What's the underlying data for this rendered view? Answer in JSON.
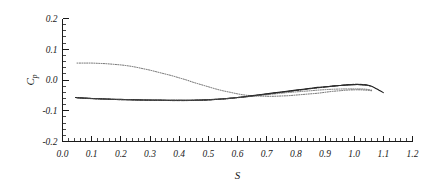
{
  "chart_data": {
    "type": "line",
    "title": "",
    "subtitle": "",
    "xlabel": "S",
    "ylabel": "C",
    "ylabel_sub": "p",
    "xlim": [
      0.0,
      1.2
    ],
    "ylim": [
      -0.2,
      0.2
    ],
    "xticks": [
      "0.0",
      "0.1",
      "0.2",
      "0.3",
      "0.4",
      "0.5",
      "0.6",
      "0.7",
      "0.8",
      "0.9",
      "1.0",
      "1.1",
      "1.2"
    ],
    "xtick_values": [
      0.0,
      0.1,
      0.2,
      0.3,
      0.4,
      0.5,
      0.6,
      0.7,
      0.8,
      0.9,
      1.0,
      1.1,
      1.2
    ],
    "yticks": [
      "0.2",
      "0.1",
      "0.0",
      "-0.1",
      "-0.2"
    ],
    "ytick_values": [
      0.2,
      0.1,
      0.0,
      -0.1,
      -0.2
    ],
    "minor_ticks_per_major": 5,
    "grid": false,
    "legend": "none",
    "legend_position": "none",
    "annotations": [],
    "series": [
      {
        "name": "upper-surface-cp",
        "style": "dotted",
        "color": "#444444",
        "width": 0.8,
        "dash": "1,1.4",
        "x": [
          0.05,
          0.075,
          0.1,
          0.125,
          0.15,
          0.175,
          0.2,
          0.225,
          0.25,
          0.275,
          0.3,
          0.325,
          0.35,
          0.375,
          0.4,
          0.425,
          0.45,
          0.475,
          0.5,
          0.525,
          0.55,
          0.575,
          0.6,
          0.625,
          0.65,
          0.675,
          0.7,
          0.725,
          0.75,
          0.775,
          0.8,
          0.825,
          0.85,
          0.875,
          0.9,
          0.925,
          0.95,
          0.975,
          1.0,
          1.02,
          1.04,
          1.06
        ],
        "y": [
          0.055,
          0.055,
          0.055,
          0.054,
          0.053,
          0.051,
          0.049,
          0.046,
          0.042,
          0.037,
          0.032,
          0.026,
          0.02,
          0.014,
          0.007,
          0.0,
          -0.008,
          -0.015,
          -0.022,
          -0.029,
          -0.035,
          -0.04,
          -0.045,
          -0.049,
          -0.051,
          -0.052,
          -0.053,
          -0.053,
          -0.052,
          -0.051,
          -0.049,
          -0.047,
          -0.045,
          -0.043,
          -0.04,
          -0.037,
          -0.035,
          -0.033,
          -0.032,
          -0.032,
          -0.033,
          -0.035
        ]
      },
      {
        "name": "lower-surface-cp-solid",
        "style": "solid",
        "color": "#1a1a1a",
        "width": 1.1,
        "dash": "",
        "x": [
          0.045,
          0.075,
          0.1,
          0.125,
          0.15,
          0.175,
          0.2,
          0.225,
          0.25,
          0.275,
          0.3,
          0.325,
          0.35,
          0.375,
          0.4,
          0.425,
          0.45,
          0.475,
          0.5,
          0.525,
          0.55,
          0.575,
          0.6,
          0.625,
          0.65,
          0.675,
          0.7,
          0.725,
          0.75,
          0.775,
          0.8,
          0.825,
          0.85,
          0.875,
          0.9,
          0.925,
          0.95,
          0.975,
          1.0,
          1.02,
          1.04,
          1.055,
          1.07,
          1.085,
          1.1
        ],
        "y": [
          -0.057,
          -0.059,
          -0.06,
          -0.061,
          -0.062,
          -0.063,
          -0.063,
          -0.064,
          -0.064,
          -0.065,
          -0.065,
          -0.065,
          -0.066,
          -0.066,
          -0.066,
          -0.066,
          -0.066,
          -0.065,
          -0.064,
          -0.063,
          -0.061,
          -0.059,
          -0.057,
          -0.054,
          -0.051,
          -0.048,
          -0.045,
          -0.042,
          -0.039,
          -0.036,
          -0.033,
          -0.03,
          -0.027,
          -0.024,
          -0.022,
          -0.02,
          -0.018,
          -0.016,
          -0.015,
          -0.015,
          -0.016,
          -0.019,
          -0.025,
          -0.033,
          -0.041
        ]
      },
      {
        "name": "lower-surface-cp-dashed",
        "style": "dashed",
        "color": "#222222",
        "width": 1.0,
        "dash": "3,1.6",
        "x": [
          0.045,
          0.075,
          0.1,
          0.125,
          0.15,
          0.175,
          0.2,
          0.225,
          0.25,
          0.275,
          0.3,
          0.325,
          0.35,
          0.375,
          0.4,
          0.425,
          0.45,
          0.475,
          0.5,
          0.525,
          0.55,
          0.575,
          0.6,
          0.625,
          0.65,
          0.675,
          0.7,
          0.725,
          0.75,
          0.775,
          0.8,
          0.825,
          0.85,
          0.875,
          0.9,
          0.925,
          0.95,
          0.975,
          1.0,
          1.02,
          1.04,
          1.055
        ],
        "y": [
          -0.057,
          -0.059,
          -0.06,
          -0.061,
          -0.062,
          -0.063,
          -0.064,
          -0.064,
          -0.065,
          -0.065,
          -0.066,
          -0.066,
          -0.066,
          -0.067,
          -0.067,
          -0.067,
          -0.066,
          -0.066,
          -0.065,
          -0.063,
          -0.062,
          -0.06,
          -0.057,
          -0.055,
          -0.052,
          -0.049,
          -0.046,
          -0.043,
          -0.04,
          -0.037,
          -0.034,
          -0.031,
          -0.028,
          -0.025,
          -0.023,
          -0.02,
          -0.018,
          -0.016,
          -0.014,
          -0.014,
          -0.016,
          -0.02
        ]
      },
      {
        "name": "lower-surface-cp-dashdot",
        "style": "dash-dot",
        "color": "#333333",
        "width": 0.9,
        "dash": "4,1.4,1,1.4",
        "x": [
          0.05,
          0.08,
          0.11,
          0.14,
          0.17,
          0.2,
          0.23,
          0.26,
          0.29,
          0.32,
          0.35,
          0.38,
          0.41,
          0.44,
          0.47,
          0.5,
          0.53,
          0.56,
          0.59,
          0.62,
          0.65,
          0.68,
          0.71,
          0.74,
          0.77,
          0.8,
          0.83,
          0.86,
          0.89,
          0.92,
          0.95,
          0.98,
          1.0,
          1.02,
          1.04
        ],
        "y": [
          -0.058,
          -0.06,
          -0.061,
          -0.062,
          -0.063,
          -0.064,
          -0.064,
          -0.065,
          -0.065,
          -0.066,
          -0.066,
          -0.066,
          -0.066,
          -0.066,
          -0.065,
          -0.064,
          -0.063,
          -0.061,
          -0.058,
          -0.055,
          -0.052,
          -0.048,
          -0.045,
          -0.041,
          -0.038,
          -0.034,
          -0.031,
          -0.027,
          -0.024,
          -0.021,
          -0.018,
          -0.016,
          -0.015,
          -0.015,
          -0.017
        ]
      },
      {
        "name": "lower-surface-cp-dotted",
        "style": "dotted",
        "color": "#555555",
        "width": 0.8,
        "dash": "1,1.3",
        "x": [
          0.05,
          0.09,
          0.13,
          0.17,
          0.21,
          0.25,
          0.29,
          0.33,
          0.37,
          0.41,
          0.45,
          0.49,
          0.53,
          0.57,
          0.61,
          0.65,
          0.69,
          0.73,
          0.77,
          0.81,
          0.85,
          0.89,
          0.93,
          0.97,
          1.0,
          1.02,
          1.04,
          1.06
        ],
        "y": [
          -0.057,
          -0.06,
          -0.062,
          -0.063,
          -0.064,
          -0.065,
          -0.065,
          -0.066,
          -0.066,
          -0.066,
          -0.066,
          -0.065,
          -0.063,
          -0.06,
          -0.057,
          -0.053,
          -0.049,
          -0.045,
          -0.041,
          -0.038,
          -0.035,
          -0.032,
          -0.03,
          -0.029,
          -0.029,
          -0.029,
          -0.03,
          -0.033
        ]
      }
    ]
  },
  "figure": {
    "background": "#ffffff",
    "axis_color": "#1a1a1a"
  }
}
